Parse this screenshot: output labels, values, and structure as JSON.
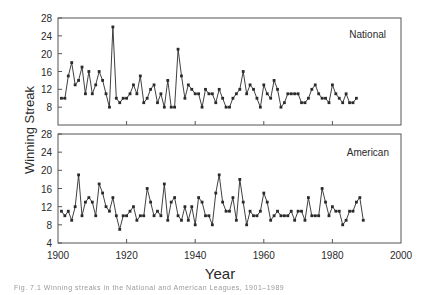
{
  "chart_data": {
    "type": "line",
    "xlabel": "Year",
    "ylabel": "Winning Streak",
    "x_ticks": [
      1900,
      1920,
      1940,
      1960,
      1980,
      2000
    ],
    "xlim": [
      1900,
      2000
    ],
    "panels": [
      {
        "name": "National",
        "ylim": [
          4,
          28
        ],
        "y_ticks": [
          8,
          12,
          16,
          20,
          24,
          28
        ],
        "start_year": 1901,
        "values": [
          10,
          10,
          15,
          18,
          13,
          14,
          17,
          11,
          16,
          11,
          13,
          16,
          14,
          11,
          8,
          26,
          10,
          9,
          10,
          10,
          11,
          13,
          11,
          15,
          9,
          10,
          12,
          13,
          9,
          11,
          8,
          14,
          8,
          8,
          21,
          15,
          10,
          13,
          12,
          11,
          11,
          8,
          12,
          11,
          11,
          9,
          12,
          10,
          8,
          8,
          10,
          11,
          12,
          16,
          11,
          13,
          12,
          10,
          8,
          13,
          11,
          10,
          14,
          12,
          8,
          9,
          11,
          11,
          11,
          11,
          9,
          9,
          10,
          12,
          13,
          11,
          10,
          10,
          9,
          13,
          11,
          10,
          9,
          11,
          9,
          9,
          10
        ]
      },
      {
        "name": "American",
        "ylim": [
          4,
          28
        ],
        "y_ticks": [
          4,
          8,
          12,
          16,
          20,
          24,
          28
        ],
        "start_year": 1901,
        "values": [
          11,
          10,
          11,
          9,
          12,
          19,
          10,
          13,
          14,
          13,
          10,
          17,
          15,
          12,
          11,
          14,
          10,
          7,
          10,
          10,
          11,
          12,
          9,
          10,
          10,
          16,
          13,
          10,
          11,
          10,
          17,
          9,
          13,
          14,
          10,
          9,
          12,
          9,
          12,
          8,
          14,
          13,
          10,
          10,
          8,
          15,
          19,
          13,
          11,
          11,
          14,
          9,
          18,
          13,
          8,
          11,
          10,
          10,
          11,
          15,
          13,
          9,
          10,
          11,
          10,
          10,
          10,
          11,
          9,
          11,
          11,
          9,
          14,
          10,
          10,
          10,
          16,
          13,
          10,
          12,
          11,
          11,
          8,
          9,
          11,
          11,
          13,
          14,
          9
        ]
      }
    ],
    "grid": false,
    "legend": "panel labels inside upper right"
  },
  "labels": {
    "y_axis": "Winning Streak",
    "x_axis": "Year",
    "panel_top": "National",
    "panel_bottom": "American",
    "caption": "Fig. 7.1  Winning streaks in the National and American Leagues, 1901–1989"
  },
  "colors": {
    "line": "#2a2a2a",
    "axis": "#555555",
    "text": "#2a2a2a"
  }
}
